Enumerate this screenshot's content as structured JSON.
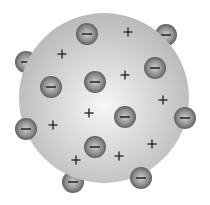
{
  "diagram": {
    "sphere": {
      "cx": 104,
      "cy": 98,
      "r": 85,
      "fill_center": "#f7f7f7",
      "fill_edge": "#b9b9b9"
    },
    "electron": {
      "r": 11,
      "highlight": "#cfcfcf",
      "body": "#8a8a8a",
      "rim": "#5e5e5e",
      "symbol": "−",
      "symbol_color": "#2a2a2a"
    },
    "plus": {
      "symbol": "+",
      "color": "#2a2a2a",
      "size": 7
    },
    "electrons_behind": [
      {
        "x": 166,
        "y": 35
      },
      {
        "x": 26,
        "y": 62
      },
      {
        "x": 73,
        "y": 182
      }
    ],
    "electrons_front": [
      {
        "x": 87,
        "y": 34
      },
      {
        "x": 155,
        "y": 68
      },
      {
        "x": 51,
        "y": 87
      },
      {
        "x": 95,
        "y": 82
      },
      {
        "x": 125,
        "y": 117
      },
      {
        "x": 185,
        "y": 118
      },
      {
        "x": 26,
        "y": 129
      },
      {
        "x": 95,
        "y": 147
      },
      {
        "x": 141,
        "y": 178
      }
    ],
    "positive_charges": [
      {
        "x": 128,
        "y": 32
      },
      {
        "x": 62,
        "y": 54
      },
      {
        "x": 125,
        "y": 75
      },
      {
        "x": 163,
        "y": 100
      },
      {
        "x": 89,
        "y": 113
      },
      {
        "x": 53,
        "y": 125
      },
      {
        "x": 152,
        "y": 144
      },
      {
        "x": 76,
        "y": 160
      },
      {
        "x": 119,
        "y": 156
      }
    ]
  }
}
